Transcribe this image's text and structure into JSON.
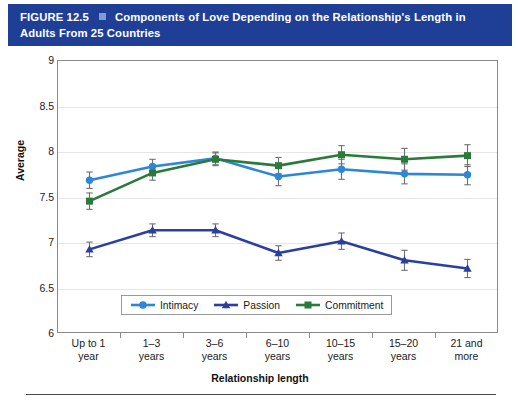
{
  "banner": {
    "figure_number": "FIGURE 12.5",
    "square_icon": "blue-square-icon",
    "title": "Components of Love Depending on the Relationship's Length in Adults From 25 Countries",
    "background_color": "#1F3F96",
    "text_color": "#FFFFFF"
  },
  "chart_data": {
    "type": "line",
    "title": "Components of Love Depending on the Relationship's Length in Adults From 25 Countries",
    "xlabel": "Relationship length",
    "ylabel": "Average",
    "ylim": [
      6,
      9
    ],
    "yticks": [
      "6",
      "6.5",
      "7",
      "7.5",
      "8",
      "8.5",
      "9"
    ],
    "grid": true,
    "legend_position": "bottom-center",
    "error_bars": true,
    "categories": [
      "Up to 1 year",
      "1–3 years",
      "3–6 years",
      "6–10 years",
      "10–15 years",
      "15–20 years",
      "21 and more"
    ],
    "category_lines": [
      [
        "Up to 1",
        "year"
      ],
      [
        "1–3",
        "years"
      ],
      [
        "3–6",
        "years"
      ],
      [
        "6–10",
        "years"
      ],
      [
        "10–15",
        "years"
      ],
      [
        "15–20",
        "years"
      ],
      [
        "21 and",
        "more"
      ]
    ],
    "series": [
      {
        "name": "Intimacy",
        "color": "#2E86D6",
        "marker": "circle",
        "values": [
          7.69,
          7.84,
          7.93,
          7.73,
          7.81,
          7.76,
          7.75
        ],
        "err_low": [
          7.6,
          7.76,
          7.86,
          7.63,
          7.7,
          7.65,
          7.64
        ],
        "err_high": [
          7.78,
          7.92,
          8.0,
          7.83,
          7.92,
          7.87,
          7.86
        ]
      },
      {
        "name": "Passion",
        "color": "#2B3F9E",
        "marker": "triangle",
        "values": [
          6.93,
          7.14,
          7.14,
          6.89,
          7.02,
          6.81,
          6.72
        ],
        "err_low": [
          6.85,
          7.07,
          7.07,
          6.81,
          6.93,
          6.7,
          6.62
        ],
        "err_high": [
          7.01,
          7.21,
          7.21,
          6.97,
          7.11,
          6.92,
          6.82
        ]
      },
      {
        "name": "Commitment",
        "color": "#2A7A3B",
        "marker": "square",
        "values": [
          7.46,
          7.77,
          7.92,
          7.85,
          7.97,
          7.92,
          7.96
        ],
        "err_low": [
          7.37,
          7.69,
          7.85,
          7.76,
          7.87,
          7.8,
          7.84
        ],
        "err_high": [
          7.55,
          7.85,
          7.99,
          7.94,
          8.07,
          8.04,
          8.08
        ]
      }
    ]
  }
}
